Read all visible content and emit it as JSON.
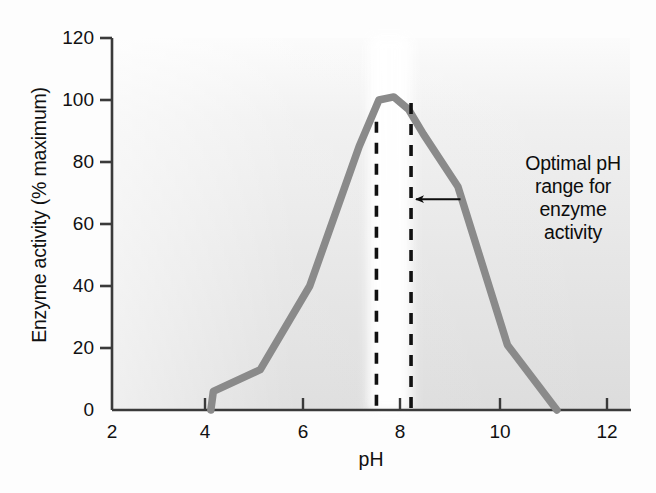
{
  "chart_data": {
    "type": "line",
    "title": "",
    "subtitle": "",
    "xlabel": "pH",
    "ylabel": "Enzyme activity (% maximum)",
    "xlim": [
      2,
      12.5
    ],
    "ylim": [
      0,
      120
    ],
    "xticks": [
      2,
      4,
      6,
      8,
      10,
      12
    ],
    "xtick_labels": [
      "2",
      "4",
      "6",
      "8",
      "10",
      "12"
    ],
    "yticks": [
      0,
      20,
      40,
      60,
      80,
      100,
      120
    ],
    "ytick_labels": [
      "0",
      "20",
      "40",
      "60",
      "80",
      "100",
      "120"
    ],
    "grid": false,
    "legend": null,
    "series": [
      {
        "name": "Enzyme activity",
        "color": "#8a8a8a",
        "x": [
          4.0,
          4.05,
          5.0,
          6.0,
          7.0,
          7.4,
          7.7,
          8.0,
          8.3,
          9.0,
          10.0,
          11.0
        ],
        "y": [
          0,
          6,
          13,
          40,
          85,
          100,
          101,
          97,
          89,
          72,
          21,
          0
        ]
      }
    ],
    "annotations": [
      {
        "name": "optimal-range-note",
        "text": "Optimal pH range for enzyme activity",
        "lines": [
          "Optimal pH",
          "range for",
          "enzyme",
          "activity"
        ],
        "arrow": {
          "from_x": 9.05,
          "to_x": 8.05,
          "y": 68
        }
      }
    ],
    "markers": {
      "vertical_dashed_lines": [
        {
          "name": "optimal-range-left",
          "x": 7.35,
          "y_top": 93,
          "y_bottom": 0,
          "style": "dashed",
          "color": "#111111"
        },
        {
          "name": "optimal-range-right",
          "x": 8.05,
          "y_top": 99,
          "y_bottom": 0,
          "style": "dashed",
          "color": "#111111"
        }
      ],
      "highlight_band": {
        "name": "optimal-range-band",
        "x_start": 7.35,
        "x_end": 8.05,
        "color": "#ffffff"
      }
    },
    "colors": {
      "curve": "#8a8a8a",
      "axis": "#333333",
      "plot_background_light": "#f4f4f4",
      "plot_background_dark": "#d9d9d9",
      "text": "#111111",
      "dashed_line": "#111111"
    }
  },
  "figure": {
    "axis_title_x": "pH",
    "axis_title_y": "Enzyme activity (% maximum)"
  },
  "annotation": {
    "line1": "Optimal pH",
    "line2": "range for",
    "line3": "enzyme",
    "line4": "activity"
  }
}
